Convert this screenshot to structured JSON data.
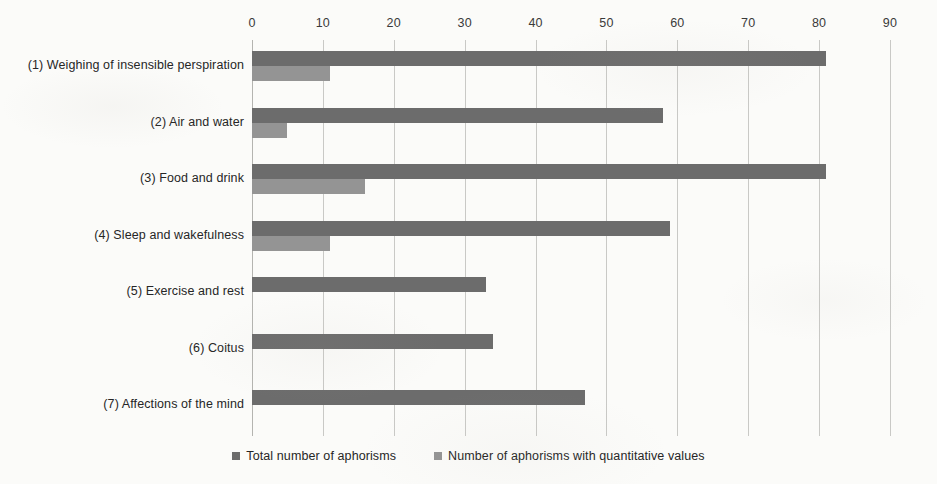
{
  "chart_data": {
    "type": "bar",
    "orientation": "horizontal",
    "title": "",
    "subtitle": "",
    "xlabel": "",
    "ylabel": "",
    "xlim": [
      0,
      90
    ],
    "xticks": [
      0,
      10,
      20,
      30,
      40,
      50,
      60,
      70,
      80,
      90
    ],
    "xtick_labels": [
      "0",
      "10",
      "20",
      "30",
      "40",
      "50",
      "60",
      "70",
      "80",
      "90"
    ],
    "grid": "vertical",
    "legend_position": "bottom-center",
    "categories": [
      "(1) Weighing of insensible perspiration",
      "(2) Air and water",
      "(3) Food and drink",
      "(4) Sleep and wakefulness",
      "(5) Exercise and rest",
      "(6) Coitus",
      "(7) Affections of the mind"
    ],
    "series": [
      {
        "name": "Total number of aphorisms",
        "color": "#6c6c6c",
        "values": [
          81,
          58,
          81,
          59,
          33,
          34,
          47
        ]
      },
      {
        "name": "Number of aphorisms with quantitative values",
        "color": "#949494",
        "values": [
          11,
          5,
          16,
          11,
          0,
          0,
          0
        ]
      }
    ]
  },
  "legend": {
    "items": [
      {
        "label": "Total number of aphorisms",
        "color": "#6c6c6c"
      },
      {
        "label": "Number of aphorisms with quantitative values",
        "color": "#949494"
      }
    ]
  },
  "colors": {
    "background": "#fbfbf9",
    "gridline": "#c9c9c6",
    "axis": "#b4b4b0",
    "text": "#262626",
    "series_total": "#6c6c6c",
    "series_quantitative": "#949494"
  }
}
